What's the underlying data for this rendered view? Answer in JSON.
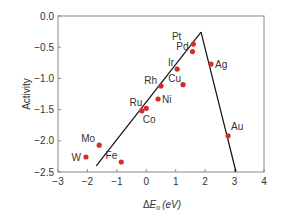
{
  "chart_data": {
    "type": "scatter",
    "title": "",
    "xlabel": "ΔE_o (eV)",
    "xlabel_parts": {
      "delta": "Δ",
      "e": "E",
      "sub": "o",
      "units": "(eV)"
    },
    "ylabel": "Activity",
    "xlim": [
      -3,
      4
    ],
    "ylim": [
      -2.5,
      0.0
    ],
    "x_ticks": [
      -3,
      -2,
      -1,
      0,
      1,
      2,
      3,
      4
    ],
    "x_tick_labels": [
      "−3",
      "−2",
      "−1",
      "0",
      "1",
      "2",
      "3",
      "4"
    ],
    "y_ticks": [
      0.0,
      -0.5,
      -1.0,
      -1.5,
      -2.0,
      -2.5
    ],
    "y_tick_labels": [
      "0.0",
      "−0.5",
      "−1.0",
      "−1.5",
      "−2.0",
      "−2.5"
    ],
    "grid": false,
    "legend": null,
    "marker_color": "#d62b2b",
    "line_color": "#111111",
    "points": [
      {
        "label": "Pt",
        "x": 1.6,
        "y": -0.45,
        "label_dx": -12,
        "label_dy": -4,
        "anchor": "end"
      },
      {
        "label": "Pd",
        "x": 1.57,
        "y": -0.57,
        "label_dx": -4,
        "label_dy": -2,
        "anchor": "end"
      },
      {
        "label": "Ir",
        "x": 1.05,
        "y": -0.85,
        "label_dx": -3,
        "label_dy": -3,
        "anchor": "end"
      },
      {
        "label": "Cu",
        "x": 1.25,
        "y": -1.1,
        "label_dx": -2,
        "label_dy": -3,
        "anchor": "end"
      },
      {
        "label": "Rh",
        "x": 0.5,
        "y": -1.12,
        "label_dx": -4,
        "label_dy": -2,
        "anchor": "end"
      },
      {
        "label": "Ni",
        "x": 0.4,
        "y": -1.33,
        "label_dx": 4,
        "label_dy": 4,
        "anchor": "start"
      },
      {
        "label": "Ru",
        "x": 0.0,
        "y": -1.48,
        "label_dx": -4,
        "label_dy": -2,
        "anchor": "end"
      },
      {
        "label": "Co",
        "x": -0.15,
        "y": -1.52,
        "label_dx": 1,
        "label_dy": 12,
        "anchor": "start"
      },
      {
        "label": "Ag",
        "x": 2.2,
        "y": -0.77,
        "label_dx": 4,
        "label_dy": 4,
        "anchor": "start"
      },
      {
        "label": "Au",
        "x": 2.78,
        "y": -1.92,
        "label_dx": 3,
        "label_dy": -6,
        "anchor": "start"
      },
      {
        "label": "Mo",
        "x": -1.6,
        "y": -2.07,
        "label_dx": -4,
        "label_dy": -3,
        "anchor": "end"
      },
      {
        "label": "W",
        "x": -2.05,
        "y": -2.26,
        "label_dx": -5,
        "label_dy": 4,
        "anchor": "end"
      },
      {
        "label": "Fe",
        "x": -0.85,
        "y": -2.34,
        "label_dx": -4,
        "label_dy": -3,
        "anchor": "end"
      }
    ],
    "volcano_lines": [
      {
        "name": "left-branch",
        "x": [
          -1.7,
          1.86
        ],
        "y": [
          -2.4,
          -0.26
        ]
      },
      {
        "name": "right-branch",
        "x": [
          1.86,
          3.05
        ],
        "y": [
          -0.26,
          -2.5
        ]
      }
    ]
  }
}
